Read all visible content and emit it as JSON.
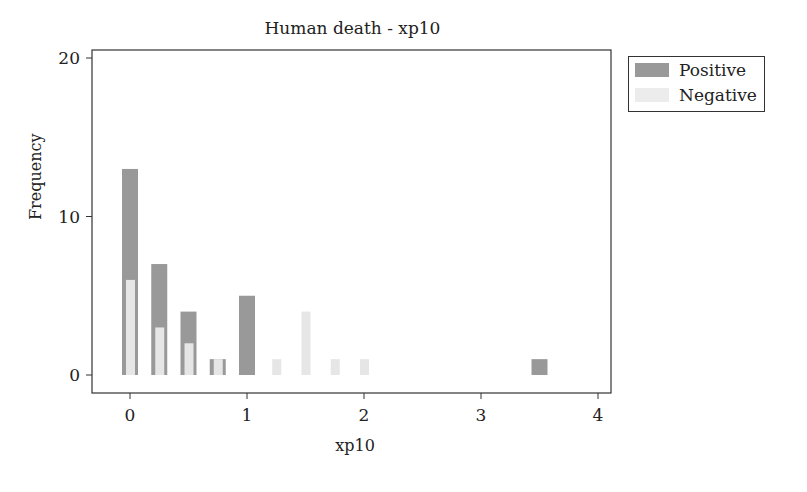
{
  "chart_data": {
    "type": "bar",
    "title": "Human death - xp10",
    "xlabel": "xp10",
    "ylabel": "Frequency",
    "xlim": [
      -0.3,
      4.1
    ],
    "ylim": [
      -1.1,
      20.5
    ],
    "xticks": [
      0,
      1,
      2,
      3,
      4
    ],
    "yticks": [
      0,
      10,
      20
    ],
    "grid": false,
    "legend_position": "right-top-outside",
    "x": [
      0,
      0.25,
      0.5,
      0.75,
      1.0,
      1.25,
      1.5,
      1.75,
      2.0,
      3.5
    ],
    "series": [
      {
        "name": "Positive",
        "color": "#999999",
        "values": [
          13,
          7,
          4,
          1,
          5,
          0,
          0,
          0,
          0,
          1
        ]
      },
      {
        "name": "Negative",
        "color": "#e6e6e6",
        "values": [
          6,
          3,
          2,
          1,
          0,
          1,
          4,
          1,
          1,
          0
        ]
      }
    ]
  },
  "legend": {
    "items": [
      {
        "label": "Positive",
        "color": "#999999"
      },
      {
        "label": "Negative",
        "color": "#e6e6e6"
      }
    ]
  }
}
